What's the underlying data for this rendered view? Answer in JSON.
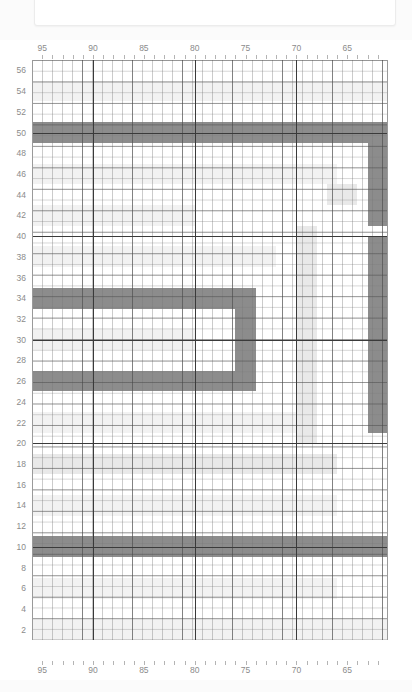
{
  "page": {
    "background": "#ffffff",
    "top_card": {
      "name": "empty-panel",
      "content": ""
    }
  },
  "chart_data": {
    "type": "heatmap",
    "title": "",
    "xlabel": "",
    "ylabel": "",
    "x_ticks": [
      95,
      90,
      85,
      80,
      75,
      70,
      65
    ],
    "y_ticks": [
      56,
      54,
      52,
      50,
      48,
      46,
      44,
      42,
      40,
      38,
      36,
      34,
      32,
      30,
      28,
      26,
      24,
      22,
      20,
      18,
      16,
      14,
      12,
      10,
      8,
      6,
      4,
      2
    ],
    "xlim": [
      96,
      61
    ],
    "ylim": [
      1,
      57
    ],
    "x_direction": "descending",
    "y_direction": "ascending",
    "grid": true,
    "legend": "none",
    "colors": {
      "wall_dark": "#8c8c8c",
      "fill_light": "#e9e9e9",
      "fill_faint": "#f2f2f2",
      "background": "#ffffff",
      "gridline_minor": "#9a9a9a",
      "gridline_major": "#4a4a4a",
      "label_text": "#8b8b8b"
    },
    "cells": [
      {
        "name": "band-y50-full",
        "x0": 96,
        "x1": 61,
        "y0": 49,
        "y1": 51,
        "shade": "wall_dark"
      },
      {
        "name": "band-y10-full",
        "x0": 96,
        "x1": 61,
        "y0": 9,
        "y1": 11,
        "shade": "wall_dark"
      },
      {
        "name": "band-y34-left",
        "x0": 96,
        "x1": 75,
        "y0": 33,
        "y1": 35,
        "shade": "wall_dark"
      },
      {
        "name": "band-y26-left",
        "x0": 96,
        "x1": 75,
        "y0": 25,
        "y1": 27,
        "shade": "wall_dark"
      },
      {
        "name": "wall-x75-vertical",
        "x0": 76,
        "x1": 74,
        "y0": 25,
        "y1": 35,
        "shade": "wall_dark"
      },
      {
        "name": "wall-x69-vertical",
        "x0": 70,
        "x1": 68,
        "y0": 20,
        "y1": 41,
        "shade": "fill_light"
      },
      {
        "name": "wall-x63-right-upper",
        "x0": 63,
        "x1": 61,
        "y0": 41,
        "y1": 49,
        "shade": "wall_dark"
      },
      {
        "name": "wall-x63-right-lower",
        "x0": 63,
        "x1": 61,
        "y0": 21,
        "y1": 40,
        "shade": "wall_dark"
      },
      {
        "name": "band-y18-left",
        "x0": 96,
        "x1": 66,
        "y0": 17,
        "y1": 19,
        "shade": "fill_light"
      },
      {
        "name": "band-y42-left",
        "x0": 96,
        "x1": 80,
        "y0": 41,
        "y1": 43,
        "shade": "fill_faint"
      },
      {
        "name": "band-y30-left",
        "x0": 96,
        "x1": 80,
        "y0": 29,
        "y1": 31,
        "shade": "fill_faint"
      },
      {
        "name": "band-y54-left",
        "x0": 96,
        "x1": 61,
        "y0": 53,
        "y1": 55,
        "shade": "fill_faint"
      },
      {
        "name": "band-y46-left",
        "x0": 96,
        "x1": 66,
        "y0": 45,
        "y1": 47,
        "shade": "fill_faint"
      },
      {
        "name": "band-y14-left",
        "x0": 96,
        "x1": 66,
        "y0": 13,
        "y1": 15,
        "shade": "fill_faint"
      },
      {
        "name": "band-y6-left",
        "x0": 96,
        "x1": 66,
        "y0": 5,
        "y1": 7,
        "shade": "fill_faint"
      },
      {
        "name": "band-y22-left",
        "x0": 96,
        "x1": 70,
        "y0": 21,
        "y1": 23,
        "shade": "fill_faint"
      },
      {
        "name": "band-y38-left",
        "x0": 96,
        "x1": 72,
        "y0": 37,
        "y1": 39,
        "shade": "fill_faint"
      },
      {
        "name": "patch-y44-x66",
        "x0": 67,
        "x1": 64,
        "y0": 43,
        "y1": 45,
        "shade": "fill_light"
      },
      {
        "name": "patch-y2-bottom",
        "x0": 96,
        "x1": 61,
        "y0": 1,
        "y1": 3,
        "shade": "fill_faint"
      }
    ]
  }
}
